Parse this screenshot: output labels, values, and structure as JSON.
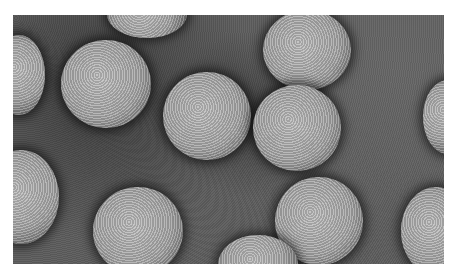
{
  "image": {
    "description": "Electron micrograph of icosahedral virus particles on a grey stained background",
    "particle_count_visible": 13,
    "colors": {
      "background": "#5c5c5c",
      "particle": "#a8a8a8",
      "halo": "#1e1e1e",
      "page": "#ffffff"
    }
  }
}
